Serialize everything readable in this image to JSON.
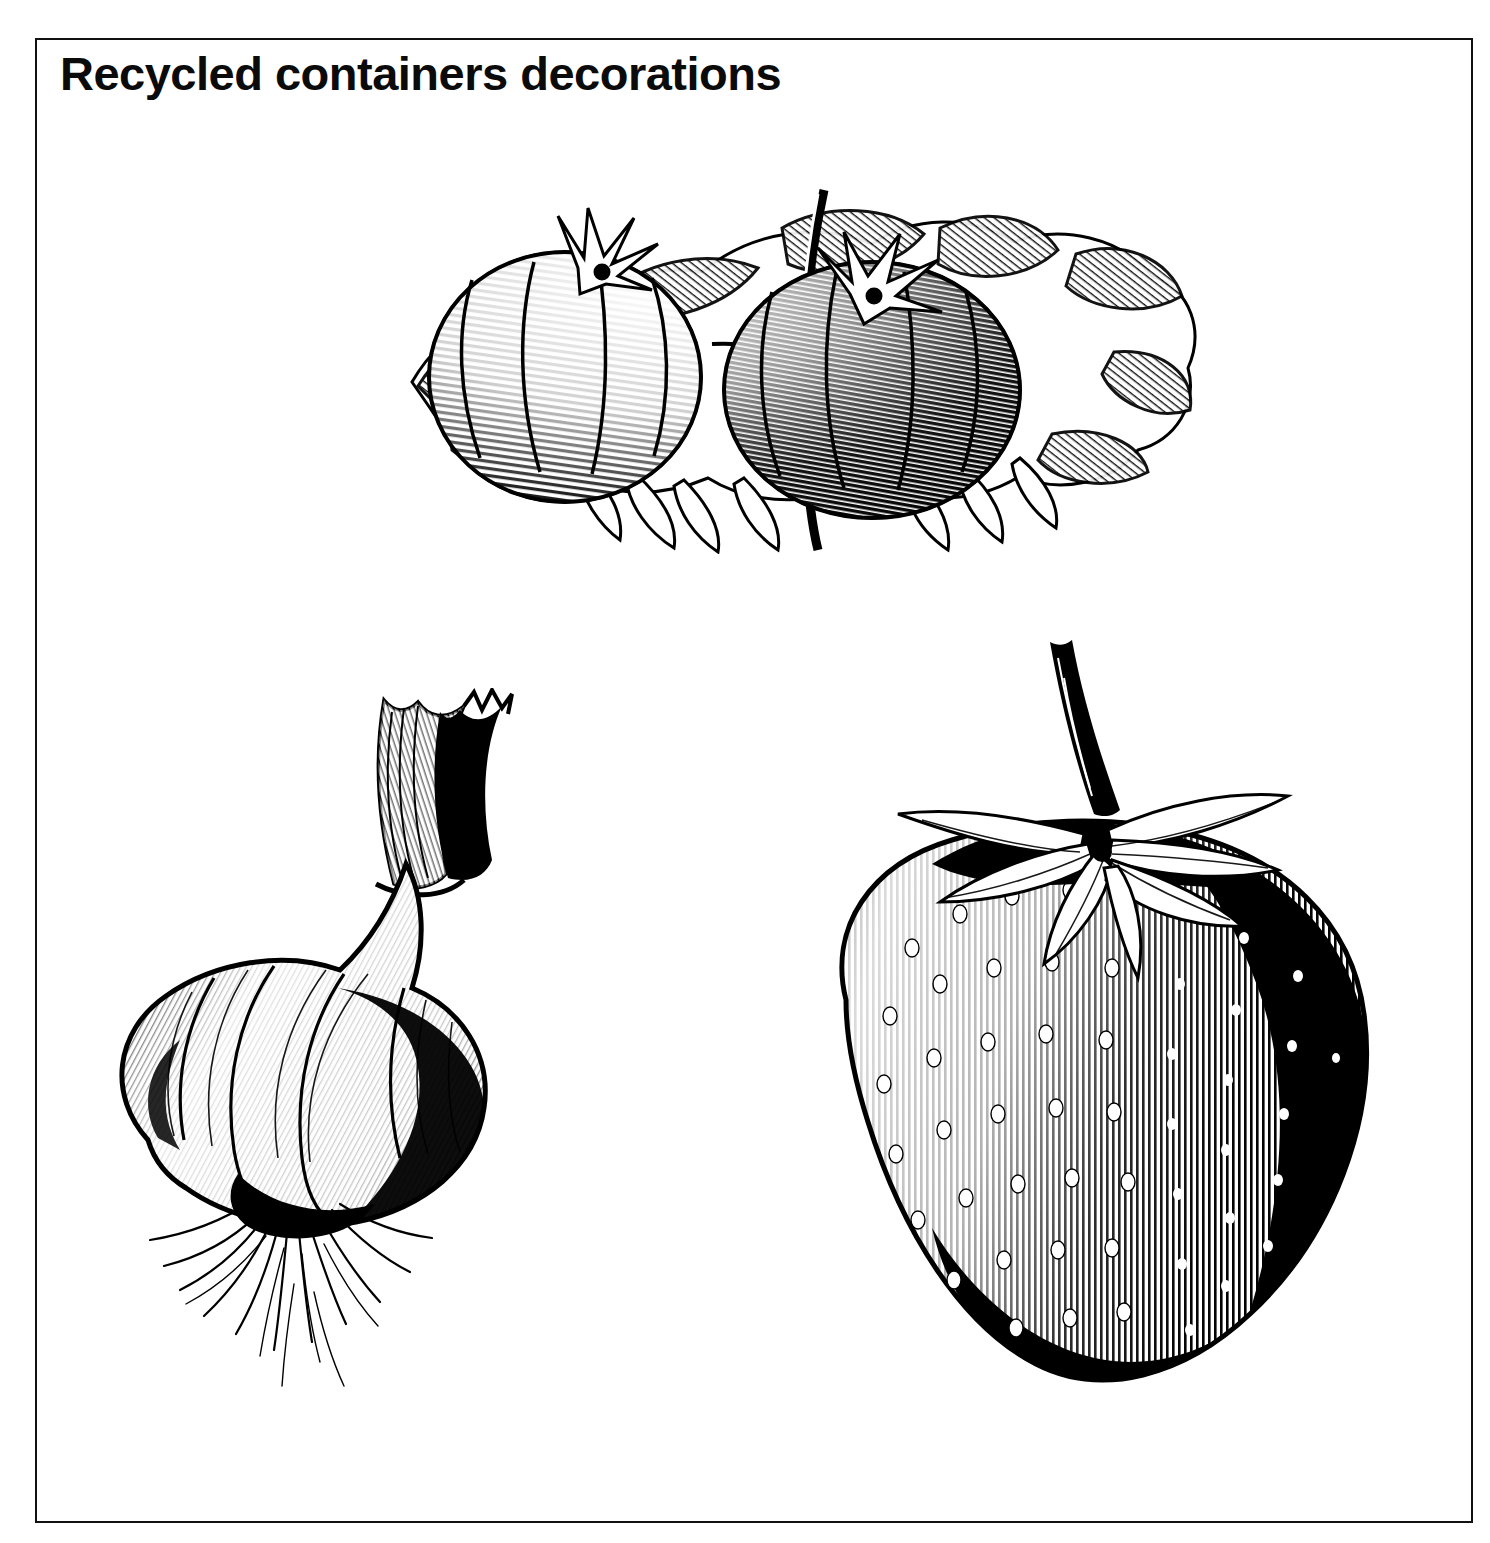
{
  "page": {
    "width": 1490,
    "height": 1543,
    "background_color": "#ffffff",
    "border_color": "#111111"
  },
  "header": {
    "title": "Recycled containers decorations"
  },
  "illustrations": [
    {
      "id": "tomatoes",
      "name": "tomato-engraving",
      "caption": "",
      "subject": "Two ribbed tomatoes on a vine with leaves",
      "style": "black-and-white woodcut engraving",
      "ink_color": "#000000",
      "position": {
        "x": 352,
        "y": 172,
        "width": 856,
        "height": 382
      }
    },
    {
      "id": "onion",
      "name": "onion-engraving",
      "caption": "",
      "subject": "Onion bulb with cut stem and roots",
      "style": "black-and-white woodcut engraving",
      "ink_color": "#000000",
      "position": {
        "x": 88,
        "y": 688,
        "width": 470,
        "height": 748
      }
    },
    {
      "id": "strawberry",
      "name": "strawberry-engraving",
      "caption": "",
      "subject": "Strawberry with calyx leaves and stem",
      "style": "black-and-white woodcut engraving",
      "ink_color": "#000000",
      "position": {
        "x": 812,
        "y": 628,
        "width": 580,
        "height": 808
      }
    }
  ]
}
